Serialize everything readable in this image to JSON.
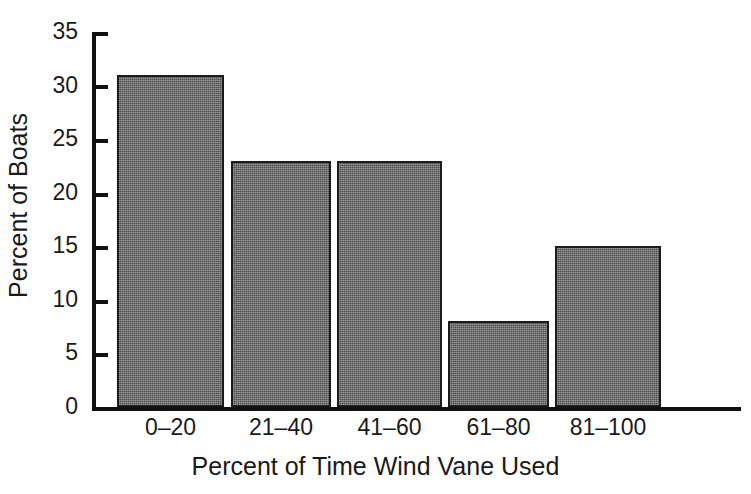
{
  "chart_data": {
    "type": "bar",
    "title": "",
    "subtitle": "",
    "categories": [
      "0–20",
      "21–40",
      "41–60",
      "61–80",
      "81–100"
    ],
    "values": [
      31,
      23,
      23,
      8,
      15
    ],
    "xlabel": "Percent of Time Wind Vane Used",
    "ylabel": "Percent of Boats",
    "ylim": [
      0,
      35
    ],
    "yticks": [
      0,
      5,
      10,
      15,
      20,
      25,
      30,
      35
    ],
    "ytick_labels": [
      "0",
      "5",
      "10",
      "15",
      "20",
      "25",
      "30",
      "35"
    ],
    "grid": false,
    "legend": false,
    "legend_position": "none",
    "annotations": [],
    "series": [
      {
        "name": "Percent of Boats",
        "values": [
          31,
          23,
          23,
          8,
          15
        ]
      }
    ],
    "colors": {
      "bar_fill": "#6e6e6e",
      "bar_edge": "#1b1b1b",
      "axis": "#111111",
      "text": "#1a1a1a",
      "background": "#ffffff"
    }
  }
}
